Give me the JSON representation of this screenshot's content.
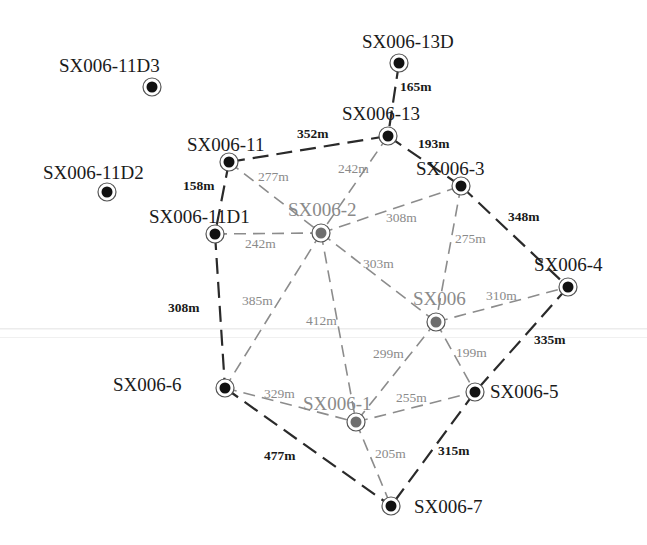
{
  "diagram": {
    "type": "well-network",
    "colors": {
      "dark_line": "#2a2a2a",
      "gray_line": "#8c8c8c",
      "dark_node": "#111111",
      "gray_node": "#6e6e6e",
      "ring": "#555555",
      "faint_band": "#e6e6e6"
    },
    "nodes": [
      {
        "id": "SX006-11D3",
        "label": "SX006-11D3",
        "x": 152,
        "y": 87,
        "tone": "dark",
        "lx": 59,
        "ly": 72,
        "anchor": "start"
      },
      {
        "id": "SX006-13D",
        "label": "SX006-13D",
        "x": 399,
        "y": 63,
        "tone": "dark",
        "lx": 362,
        "ly": 48,
        "anchor": "start"
      },
      {
        "id": "SX006-13",
        "label": "SX006-13",
        "x": 388,
        "y": 136,
        "tone": "dark",
        "lx": 342,
        "ly": 120,
        "anchor": "start"
      },
      {
        "id": "SX006-11",
        "label": "SX006-11",
        "x": 229,
        "y": 162,
        "tone": "dark",
        "lx": 187,
        "ly": 151,
        "anchor": "start"
      },
      {
        "id": "SX006-11D2",
        "label": "SX006-11D2",
        "x": 107,
        "y": 192,
        "tone": "dark",
        "lx": 43,
        "ly": 179,
        "anchor": "start"
      },
      {
        "id": "SX006-3",
        "label": "SX006-3",
        "x": 461,
        "y": 186,
        "tone": "dark",
        "lx": 416,
        "ly": 175,
        "anchor": "start"
      },
      {
        "id": "SX006-11D1",
        "label": "SX006-11D1",
        "x": 215,
        "y": 234,
        "tone": "dark",
        "lx": 149,
        "ly": 223,
        "anchor": "start"
      },
      {
        "id": "SX006-2",
        "label": "SX006-2",
        "x": 321,
        "y": 233,
        "tone": "gray",
        "lx": 288,
        "ly": 216,
        "anchor": "start"
      },
      {
        "id": "SX006-4",
        "label": "SX006-4",
        "x": 568,
        "y": 287,
        "tone": "dark",
        "lx": 534,
        "ly": 271,
        "anchor": "start"
      },
      {
        "id": "SX006",
        "label": "SX006",
        "x": 436,
        "y": 322,
        "tone": "gray",
        "lx": 413,
        "ly": 305,
        "anchor": "start"
      },
      {
        "id": "SX006-6",
        "label": "SX006-6",
        "x": 225,
        "y": 388,
        "tone": "dark",
        "lx": 113,
        "ly": 391,
        "anchor": "start"
      },
      {
        "id": "SX006-5",
        "label": "SX006-5",
        "x": 475,
        "y": 392,
        "tone": "dark",
        "lx": 490,
        "ly": 398,
        "anchor": "start"
      },
      {
        "id": "SX006-1",
        "label": "SX006-1",
        "x": 356,
        "y": 422,
        "tone": "gray",
        "lx": 303,
        "ly": 410,
        "anchor": "start"
      },
      {
        "id": "SX006-7",
        "label": "SX006-7",
        "x": 391,
        "y": 506,
        "tone": "dark",
        "lx": 414,
        "ly": 513,
        "anchor": "start"
      }
    ],
    "edges": [
      {
        "from": "SX006-13D",
        "to": "SX006-13",
        "distance": "165m",
        "tone": "dark",
        "lx": 400,
        "ly": 91
      },
      {
        "from": "SX006-11",
        "to": "SX006-13",
        "distance": "352m",
        "tone": "dark",
        "lx": 297,
        "ly": 138
      },
      {
        "from": "SX006-13",
        "to": "SX006-3",
        "distance": "193m",
        "tone": "dark",
        "lx": 418,
        "ly": 148
      },
      {
        "from": "SX006-11",
        "to": "SX006-2",
        "distance": "277m",
        "tone": "gray",
        "lx": 258,
        "ly": 181
      },
      {
        "from": "SX006-13",
        "to": "SX006-2",
        "distance": "242m",
        "tone": "gray",
        "lx": 338,
        "ly": 173
      },
      {
        "from": "SX006-11",
        "to": "SX006-11D1",
        "distance": "158m",
        "tone": "dark",
        "lx": 183,
        "ly": 190
      },
      {
        "from": "SX006-2",
        "to": "SX006-3",
        "distance": "308m",
        "tone": "gray",
        "lx": 386,
        "ly": 222
      },
      {
        "from": "SX006-11D1",
        "to": "SX006-2",
        "distance": "242m",
        "tone": "gray",
        "lx": 245,
        "ly": 248
      },
      {
        "from": "SX006-3",
        "to": "SX006-4",
        "distance": "348m",
        "tone": "dark",
        "lx": 508,
        "ly": 221
      },
      {
        "from": "SX006-3",
        "to": "SX006",
        "distance": "275m",
        "tone": "gray",
        "lx": 455,
        "ly": 243
      },
      {
        "from": "SX006-2",
        "to": "SX006",
        "distance": "303m",
        "tone": "gray",
        "lx": 363,
        "ly": 268
      },
      {
        "from": "SX006-11D1",
        "to": "SX006-6",
        "distance": "308m",
        "tone": "dark",
        "lx": 168,
        "ly": 312
      },
      {
        "from": "SX006-2",
        "to": "SX006-6",
        "distance": "385m",
        "tone": "gray",
        "lx": 242,
        "ly": 305
      },
      {
        "from": "SX006-2",
        "to": "SX006-1",
        "distance": "412m",
        "tone": "gray",
        "lx": 306,
        "ly": 325
      },
      {
        "from": "SX006",
        "to": "SX006-4",
        "distance": "310m",
        "tone": "gray",
        "lx": 486,
        "ly": 300
      },
      {
        "from": "SX006-4",
        "to": "SX006-5",
        "distance": "335m",
        "tone": "dark",
        "lx": 534,
        "ly": 344
      },
      {
        "from": "SX006",
        "to": "SX006-1",
        "distance": "299m",
        "tone": "gray",
        "lx": 373,
        "ly": 358
      },
      {
        "from": "SX006",
        "to": "SX006-5",
        "distance": "199m",
        "tone": "gray",
        "lx": 456,
        "ly": 357
      },
      {
        "from": "SX006-6",
        "to": "SX006-1",
        "distance": "329m",
        "tone": "gray",
        "lx": 264,
        "ly": 398
      },
      {
        "from": "SX006-1",
        "to": "SX006-5",
        "distance": "255m",
        "tone": "gray",
        "lx": 396,
        "ly": 402
      },
      {
        "from": "SX006-6",
        "to": "SX006-7",
        "distance": "477m",
        "tone": "dark",
        "lx": 264,
        "ly": 460
      },
      {
        "from": "SX006-1",
        "to": "SX006-7",
        "distance": "205m",
        "tone": "gray",
        "lx": 375,
        "ly": 458
      },
      {
        "from": "SX006-5",
        "to": "SX006-7",
        "distance": "315m",
        "tone": "dark",
        "lx": 438,
        "ly": 455
      }
    ]
  }
}
